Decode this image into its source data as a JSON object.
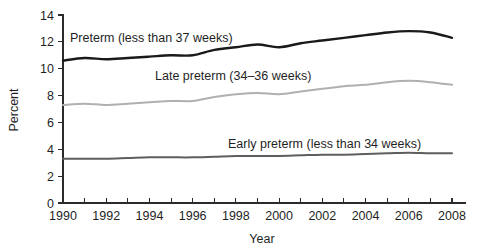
{
  "chart_data": {
    "type": "line",
    "title": "",
    "xlabel": "Year",
    "ylabel": "Percent",
    "xlim": [
      1990,
      2008
    ],
    "ylim": [
      0,
      14
    ],
    "grid": false,
    "legend_position": "inline-annotations",
    "x": [
      1990,
      1991,
      1992,
      1993,
      1994,
      1995,
      1996,
      1997,
      1998,
      1999,
      2000,
      2001,
      2002,
      2003,
      2004,
      2005,
      2006,
      2007,
      2008
    ],
    "x_tick_labels": [
      "1990",
      "1992",
      "1994",
      "1996",
      "1998",
      "2000",
      "2002",
      "2004",
      "2006",
      "2008"
    ],
    "x_tick_values": [
      1990,
      1992,
      1994,
      1996,
      1998,
      2000,
      2002,
      2004,
      2006,
      2008
    ],
    "y_tick_labels": [
      "0",
      "2",
      "4",
      "6",
      "8",
      "10",
      "12",
      "14"
    ],
    "y_tick_values": [
      0,
      2,
      4,
      6,
      8,
      10,
      12,
      14
    ],
    "series": [
      {
        "name": "Preterm (less than 37 weeks)",
        "color": "#1a1a1a",
        "stroke_width": 2.4,
        "values": [
          10.6,
          10.8,
          10.7,
          10.8,
          10.9,
          11.0,
          11.0,
          11.4,
          11.6,
          11.8,
          11.6,
          11.9,
          12.1,
          12.3,
          12.5,
          12.7,
          12.8,
          12.7,
          12.3
        ]
      },
      {
        "name": "Late preterm (34–36 weeks)",
        "color": "#b0b0b0",
        "stroke_width": 2.0,
        "values": [
          7.3,
          7.4,
          7.3,
          7.4,
          7.5,
          7.6,
          7.6,
          7.9,
          8.1,
          8.2,
          8.1,
          8.3,
          8.5,
          8.7,
          8.8,
          9.0,
          9.1,
          9.0,
          8.8
        ]
      },
      {
        "name": "Early preterm (less than 34 weeks)",
        "color": "#5e5e5e",
        "stroke_width": 2.0,
        "values": [
          3.3,
          3.3,
          3.3,
          3.35,
          3.4,
          3.4,
          3.4,
          3.45,
          3.5,
          3.5,
          3.5,
          3.55,
          3.6,
          3.6,
          3.65,
          3.7,
          3.75,
          3.7,
          3.7
        ]
      }
    ],
    "annotations": [
      {
        "text": "Preterm (less than 37 weeks)",
        "x_px": 70,
        "y_px": 42
      },
      {
        "text": "Late preterm (34–36 weeks)",
        "x_px": 155,
        "y_px": 80
      },
      {
        "text": "Early preterm (less than 34 weeks)",
        "x_px": 228,
        "y_px": 148
      }
    ]
  }
}
